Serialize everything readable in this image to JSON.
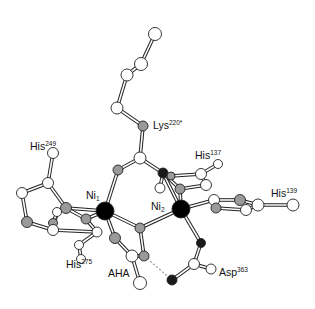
{
  "figure": {
    "labels": [
      {
        "id": "lys",
        "base": "Lys",
        "sup": "220*",
        "sub": "",
        "x": 153,
        "y": 120
      },
      {
        "id": "his249",
        "base": "His",
        "sup": "249",
        "sub": "",
        "x": 30,
        "y": 141
      },
      {
        "id": "his137",
        "base": "His",
        "sup": "137",
        "sub": "",
        "x": 195,
        "y": 150
      },
      {
        "id": "his139",
        "base": "His",
        "sup": "139",
        "sub": "",
        "x": 271,
        "y": 188
      },
      {
        "id": "ni1",
        "base": "Ni",
        "sup": "",
        "sub": "1",
        "x": 86,
        "y": 190
      },
      {
        "id": "ni2",
        "base": "Ni",
        "sup": "",
        "sub": "2",
        "x": 151,
        "y": 201
      },
      {
        "id": "his275",
        "base": "His",
        "sup": "275",
        "sub": "",
        "x": 66,
        "y": 259
      },
      {
        "id": "aha",
        "base": "AHA",
        "sup": "",
        "sub": "",
        "x": 108,
        "y": 268
      },
      {
        "id": "asp363",
        "base": "Asp",
        "sup": "363",
        "sub": "",
        "x": 219,
        "y": 267
      }
    ],
    "atom_colors": {
      "white": "#ffffff",
      "gray": "#9a9a9a",
      "dark": "#1a1a1a",
      "metal": "#000000"
    },
    "atoms": [
      {
        "x": 155,
        "y": 34,
        "r": 6.5,
        "c": "white"
      },
      {
        "x": 141,
        "y": 64,
        "r": 6.5,
        "c": "white"
      },
      {
        "x": 127,
        "y": 75,
        "r": 6,
        "c": "white"
      },
      {
        "x": 117,
        "y": 108,
        "r": 6,
        "c": "white"
      },
      {
        "x": 143,
        "y": 126,
        "r": 5,
        "c": "gray"
      },
      {
        "x": 140,
        "y": 158,
        "r": 6,
        "c": "white"
      },
      {
        "x": 118,
        "y": 170,
        "r": 5,
        "c": "gray"
      },
      {
        "x": 163,
        "y": 173,
        "r": 5,
        "c": "dark"
      },
      {
        "x": 171,
        "y": 176,
        "r": 4,
        "c": "gray"
      },
      {
        "x": 160,
        "y": 188,
        "r": 5,
        "c": "white"
      },
      {
        "x": 180,
        "y": 189,
        "r": 5,
        "c": "gray"
      },
      {
        "x": 201,
        "y": 174,
        "r": 5.5,
        "c": "white"
      },
      {
        "x": 218,
        "y": 164,
        "r": 4.5,
        "c": "white"
      },
      {
        "x": 206,
        "y": 185,
        "r": 5.5,
        "c": "white"
      },
      {
        "x": 214,
        "y": 200,
        "r": 5.5,
        "c": "white"
      },
      {
        "x": 216,
        "y": 208,
        "r": 5,
        "c": "gray"
      },
      {
        "x": 240,
        "y": 200,
        "r": 5.5,
        "c": "gray"
      },
      {
        "x": 246,
        "y": 210,
        "r": 5.5,
        "c": "white"
      },
      {
        "x": 258,
        "y": 205,
        "r": 6,
        "c": "white"
      },
      {
        "x": 293,
        "y": 205,
        "r": 6,
        "c": "white"
      },
      {
        "x": 53,
        "y": 153,
        "r": 5.5,
        "c": "white"
      },
      {
        "x": 48,
        "y": 183,
        "r": 5.5,
        "c": "white"
      },
      {
        "x": 22,
        "y": 193,
        "r": 5.5,
        "c": "white"
      },
      {
        "x": 27,
        "y": 222,
        "r": 5.5,
        "c": "gray"
      },
      {
        "x": 66,
        "y": 208,
        "r": 5.5,
        "c": "gray"
      },
      {
        "x": 57,
        "y": 212,
        "r": 4.5,
        "c": "white"
      },
      {
        "x": 53,
        "y": 223,
        "r": 4.5,
        "c": "gray"
      },
      {
        "x": 53,
        "y": 230,
        "r": 5.5,
        "c": "white"
      },
      {
        "x": 86,
        "y": 219,
        "r": 5,
        "c": "gray"
      },
      {
        "x": 97,
        "y": 232,
        "r": 5,
        "c": "white"
      },
      {
        "x": 79,
        "y": 245,
        "r": 4.5,
        "c": "white"
      },
      {
        "x": 81,
        "y": 259,
        "r": 4.5,
        "c": "white"
      },
      {
        "x": 140,
        "y": 228,
        "r": 5,
        "c": "gray"
      },
      {
        "x": 115,
        "y": 238,
        "r": 5.5,
        "c": "gray"
      },
      {
        "x": 132,
        "y": 256,
        "r": 6,
        "c": "white"
      },
      {
        "x": 144,
        "y": 256,
        "r": 5,
        "c": "gray"
      },
      {
        "x": 140,
        "y": 283,
        "r": 6.5,
        "c": "white"
      },
      {
        "x": 201,
        "y": 243,
        "r": 4.5,
        "c": "dark"
      },
      {
        "x": 194,
        "y": 264,
        "r": 5.5,
        "c": "white"
      },
      {
        "x": 211,
        "y": 269,
        "r": 5,
        "c": "white"
      },
      {
        "x": 172,
        "y": 280,
        "r": 5,
        "c": "dark"
      },
      {
        "x": 105,
        "y": 211,
        "r": 9,
        "c": "metal"
      },
      {
        "x": 181,
        "y": 209,
        "r": 9,
        "c": "metal"
      }
    ],
    "bonds": [
      [
        155,
        34,
        141,
        64
      ],
      [
        141,
        64,
        127,
        75
      ],
      [
        127,
        75,
        117,
        108
      ],
      [
        117,
        108,
        143,
        126
      ],
      [
        143,
        126,
        140,
        158
      ],
      [
        140,
        158,
        118,
        170
      ],
      [
        140,
        158,
        163,
        173
      ],
      [
        118,
        170,
        105,
        211
      ],
      [
        163,
        173,
        181,
        209
      ],
      [
        171,
        176,
        201,
        174
      ],
      [
        201,
        174,
        218,
        164
      ],
      [
        163,
        173,
        180,
        189
      ],
      [
        180,
        189,
        206,
        185
      ],
      [
        206,
        185,
        201,
        174
      ],
      [
        180,
        189,
        181,
        209
      ],
      [
        160,
        188,
        163,
        173
      ],
      [
        181,
        209,
        214,
        200
      ],
      [
        214,
        200,
        240,
        200
      ],
      [
        216,
        208,
        246,
        210
      ],
      [
        240,
        200,
        258,
        205
      ],
      [
        246,
        210,
        258,
        205
      ],
      [
        258,
        205,
        293,
        205
      ],
      [
        214,
        200,
        216,
        208
      ],
      [
        53,
        153,
        48,
        183
      ],
      [
        48,
        183,
        22,
        193
      ],
      [
        22,
        193,
        27,
        222
      ],
      [
        27,
        222,
        53,
        230
      ],
      [
        48,
        183,
        66,
        208
      ],
      [
        66,
        208,
        105,
        211
      ],
      [
        66,
        208,
        86,
        219
      ],
      [
        86,
        219,
        105,
        211
      ],
      [
        53,
        230,
        57,
        212
      ],
      [
        53,
        230,
        97,
        232
      ],
      [
        97,
        232,
        86,
        219
      ],
      [
        97,
        232,
        79,
        245
      ],
      [
        79,
        245,
        81,
        259
      ],
      [
        53,
        223,
        57,
        212
      ],
      [
        105,
        211,
        140,
        228
      ],
      [
        140,
        228,
        181,
        209
      ],
      [
        105,
        211,
        115,
        238
      ],
      [
        115,
        238,
        132,
        256
      ],
      [
        132,
        256,
        140,
        283
      ],
      [
        140,
        228,
        144,
        256
      ],
      [
        144,
        256,
        132,
        256
      ],
      [
        181,
        209,
        201,
        243
      ],
      [
        201,
        243,
        194,
        264
      ],
      [
        194,
        264,
        211,
        269
      ],
      [
        194,
        264,
        172,
        280
      ]
    ],
    "hbond": [
      144,
      256,
      172,
      280
    ]
  }
}
